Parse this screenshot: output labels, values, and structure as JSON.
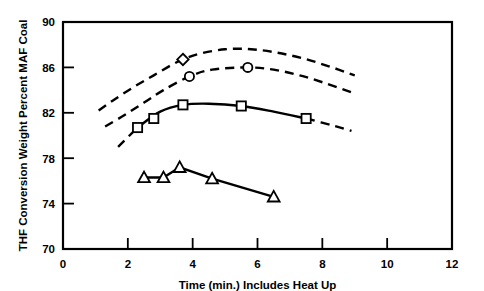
{
  "chart_data": {
    "type": "line",
    "title": "",
    "xlabel": "Time (min.) Includes Heat Up",
    "ylabel": "THF Conversion Weight Percent MAF Coal",
    "xlim": [
      0,
      12
    ],
    "ylim": [
      70,
      90
    ],
    "xticks": [
      0,
      2,
      4,
      6,
      8,
      10,
      12
    ],
    "yticks": [
      70,
      74,
      78,
      82,
      86,
      90
    ],
    "xtick_labels": [
      "0",
      "2",
      "4",
      "6",
      "8",
      "10",
      "12"
    ],
    "ytick_labels": [
      "70",
      "74",
      "78",
      "82",
      "86",
      "90"
    ],
    "grid": false,
    "legend": "none",
    "frame": "box",
    "series": [
      {
        "name": "diamond-dashed-curve",
        "marker": "diamond",
        "linestyle": "dashed",
        "color": "#000000",
        "x": [
          3.7
        ],
        "y": [
          86.7
        ],
        "curve_x": [
          1.1,
          1.6,
          2.2,
          2.8,
          3.4,
          3.7,
          4.2,
          5.0,
          5.8,
          6.6,
          7.4,
          8.2,
          9.0
        ],
        "curve_y": [
          82.2,
          83.2,
          84.3,
          85.3,
          86.3,
          86.7,
          87.2,
          87.6,
          87.6,
          87.3,
          86.8,
          86.1,
          85.3
        ]
      },
      {
        "name": "circle-dashed-curve",
        "marker": "circle",
        "linestyle": "dashed",
        "color": "#000000",
        "x": [
          3.9,
          5.7
        ],
        "y": [
          85.2,
          86.0
        ],
        "curve_x": [
          1.3,
          1.9,
          2.5,
          3.1,
          3.9,
          4.6,
          5.7,
          6.5,
          7.3,
          8.1,
          8.9
        ],
        "curve_y": [
          80.8,
          81.8,
          82.9,
          84.0,
          85.2,
          85.8,
          86.0,
          85.8,
          85.3,
          84.6,
          83.8
        ]
      },
      {
        "name": "square-solid-series",
        "marker": "square",
        "linestyle": "solid-then-dashed",
        "color": "#000000",
        "x": [
          2.3,
          2.8,
          3.7,
          5.5,
          7.5
        ],
        "y": [
          80.7,
          81.5,
          82.7,
          82.6,
          81.5
        ],
        "curve_x": [
          1.7,
          2.3,
          3.0,
          3.7,
          4.5,
          5.5,
          6.5,
          7.5,
          8.3,
          8.9
        ],
        "curve_y": [
          79.0,
          80.7,
          82.1,
          82.7,
          82.8,
          82.6,
          82.1,
          81.5,
          80.9,
          80.4
        ]
      },
      {
        "name": "triangle-solid-series",
        "marker": "triangle",
        "linestyle": "solid",
        "color": "#000000",
        "x": [
          2.5,
          3.1,
          3.6,
          4.6,
          6.5
        ],
        "y": [
          76.3,
          76.3,
          77.2,
          76.2,
          74.6
        ]
      }
    ]
  },
  "axes": {
    "x_title": "Time (min.) Includes Heat Up",
    "y_title": "THF Conversion Weight Percent MAF Coal"
  }
}
